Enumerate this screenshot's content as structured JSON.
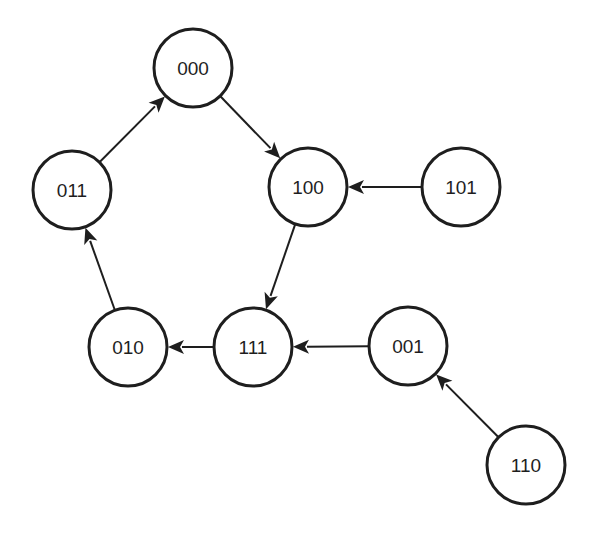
{
  "diagram": {
    "type": "state-transition-graph",
    "colors": {
      "stroke": "#1e1e1e",
      "fill": "#ffffff",
      "text": "#1e1e1e",
      "background": "#ffffff"
    },
    "node_radius": 39,
    "nodes": [
      {
        "id": "000",
        "label": "000",
        "cx": 193,
        "cy": 68
      },
      {
        "id": "011",
        "label": "011",
        "cx": 72,
        "cy": 190
      },
      {
        "id": "100",
        "label": "100",
        "cx": 308,
        "cy": 187
      },
      {
        "id": "101",
        "label": "101",
        "cx": 461,
        "cy": 187
      },
      {
        "id": "010",
        "label": "010",
        "cx": 128,
        "cy": 347
      },
      {
        "id": "111",
        "label": "111",
        "cx": 253,
        "cy": 347
      },
      {
        "id": "001",
        "label": "001",
        "cx": 408,
        "cy": 346
      },
      {
        "id": "110",
        "label": "110",
        "cx": 526,
        "cy": 465
      }
    ],
    "edges": [
      {
        "from": "011",
        "to": "000"
      },
      {
        "from": "000",
        "to": "100"
      },
      {
        "from": "101",
        "to": "100"
      },
      {
        "from": "100",
        "to": "111"
      },
      {
        "from": "001",
        "to": "111"
      },
      {
        "from": "111",
        "to": "010"
      },
      {
        "from": "010",
        "to": "011"
      },
      {
        "from": "110",
        "to": "001"
      }
    ]
  }
}
